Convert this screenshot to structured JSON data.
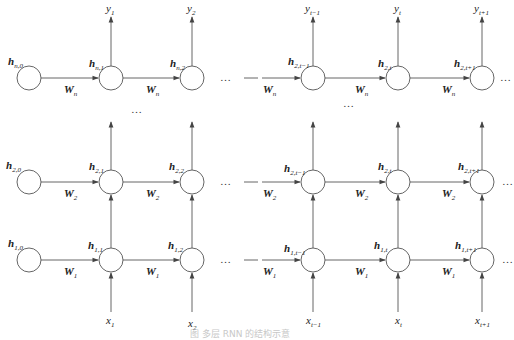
{
  "diagram": {
    "ellipsis": "…",
    "columns_x": [
      29,
      111,
      192,
      313,
      398,
      482
    ],
    "rows_y": {
      "top": 78,
      "middle": 182,
      "bottom": 260
    },
    "node_radius": 12,
    "layers": [
      {
        "id": "layer-n",
        "weight": {
          "base": "W",
          "sub": "n"
        },
        "hidden": [
          {
            "base": "h",
            "sub": "n,0"
          },
          {
            "base": "h",
            "sub": "n,1"
          },
          {
            "base": "h",
            "sub": "n,2"
          },
          {
            "base": "h",
            "sub": "2,t−1"
          },
          {
            "base": "h",
            "sub": "2,t"
          },
          {
            "base": "h",
            "sub": "2,t+1"
          }
        ]
      },
      {
        "id": "layer-2",
        "weight": {
          "base": "W",
          "sub": "2"
        },
        "hidden": [
          {
            "base": "h",
            "sub": "2,0"
          },
          {
            "base": "h",
            "sub": "2,1"
          },
          {
            "base": "h",
            "sub": "2,2"
          },
          {
            "base": "h",
            "sub": "2,t−1"
          },
          {
            "base": "h",
            "sub": "2,t"
          },
          {
            "base": "h",
            "sub": "2,t+1"
          }
        ]
      },
      {
        "id": "layer-1",
        "weight": {
          "base": "W",
          "sub": "1"
        },
        "hidden": [
          {
            "base": "h",
            "sub": "1,0"
          },
          {
            "base": "h",
            "sub": "1,1"
          },
          {
            "base": "h",
            "sub": "1,2"
          },
          {
            "base": "h",
            "sub": "1,t−1"
          },
          {
            "base": "h",
            "sub": "1,t"
          },
          {
            "base": "h",
            "sub": "1,t+1"
          }
        ]
      }
    ],
    "outputs": [
      {
        "base": "y",
        "sub": "1"
      },
      {
        "base": "y",
        "sub": "2"
      },
      {
        "base": "y",
        "sub": "t−1"
      },
      {
        "base": "y",
        "sub": "t"
      },
      {
        "base": "y",
        "sub": "t+1"
      }
    ],
    "inputs": [
      {
        "base": "x",
        "sub": "1"
      },
      {
        "base": "x",
        "sub": "2"
      },
      {
        "base": "x",
        "sub": "t−1"
      },
      {
        "base": "x",
        "sub": "t"
      },
      {
        "base": "x",
        "sub": "t+1"
      }
    ],
    "caption": "图 多层 RNN 的结构示意",
    "colors": {
      "stroke": "#555555",
      "text": "#222222",
      "caption": "#c8c8c8"
    }
  }
}
